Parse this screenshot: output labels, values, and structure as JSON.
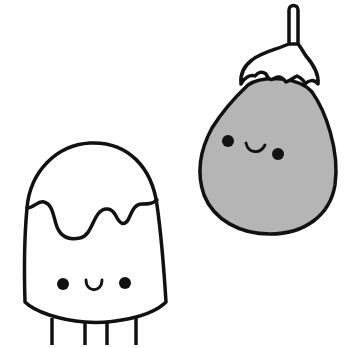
{
  "illustration": {
    "description": "Two cute kawaii characters: a drip-topped popsicle/marshmallow with legs and a smiling eggplant",
    "colors": {
      "background": "#ffffff",
      "outline": "#111111",
      "eggplant_fill": "#b5b5b5",
      "cap_fill": "#ffffff",
      "popsicle_fill": "#ffffff"
    },
    "characters": [
      {
        "name": "popsicle",
        "expression": "smile"
      },
      {
        "name": "eggplant",
        "expression": "smile"
      }
    ]
  }
}
